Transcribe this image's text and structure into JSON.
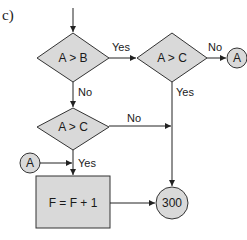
{
  "figure": {
    "panel_label": "c)"
  },
  "nodes": {
    "decision_1": {
      "text": "A > B"
    },
    "decision_2": {
      "text": "A > C"
    },
    "decision_3": {
      "text": "A > C"
    },
    "process_1": {
      "text": "F = F + 1"
    },
    "connector_out": {
      "text": "A"
    },
    "connector_in": {
      "text": "A"
    },
    "terminal_300": {
      "text": "300"
    }
  },
  "edges": {
    "d1_yes": "Yes",
    "d1_no": "No",
    "d2_no": "No",
    "d2_yes": "Yes",
    "d3_no": "No",
    "d3_yes": "Yes"
  },
  "colors": {
    "shape_fill": "#d9d9d9",
    "stroke": "#333333",
    "background": "#ffffff"
  }
}
